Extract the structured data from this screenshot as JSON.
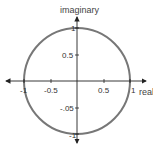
{
  "diagram": {
    "axes": {
      "x_label": "real",
      "y_label": "imaginary"
    },
    "ticks": {
      "x": [
        {
          "value": -1,
          "label": "-1"
        },
        {
          "value": -0.5,
          "label": "-0.5"
        },
        {
          "value": 0.5,
          "label": "0.5"
        },
        {
          "value": 1,
          "label": "1"
        }
      ],
      "y": [
        {
          "value": 1,
          "label": "1"
        },
        {
          "value": 0.5,
          "label": "0.5"
        },
        {
          "value": -0.5,
          "label": "-.05"
        },
        {
          "value": -1,
          "label": "-1"
        }
      ]
    },
    "circle": {
      "center": [
        0,
        0
      ],
      "radius": 1,
      "stroke_color": "#777777"
    },
    "axis_color": "#222222"
  }
}
